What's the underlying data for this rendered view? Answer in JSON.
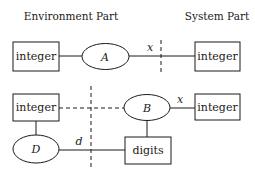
{
  "headers": {
    "environment": "Environment Part",
    "system": "System Part"
  },
  "diagram_top": {
    "left_box": "integer",
    "ellipse": "A",
    "edge_label": "x",
    "right_box": "integer"
  },
  "diagram_bottom": {
    "left_box": "integer",
    "ellipse_b": "B",
    "edge_label_x": "x",
    "right_box": "integer",
    "ellipse_d": "D",
    "edge_label_d": "d",
    "digits_box": "digits"
  },
  "colors": {
    "stroke": "#1a1a1a",
    "background": "#ffffff"
  }
}
